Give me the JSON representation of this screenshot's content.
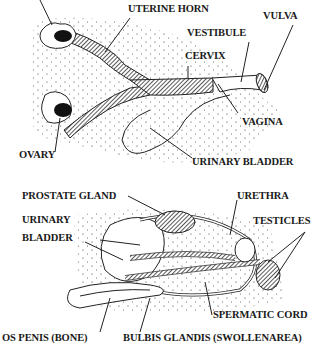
{
  "diagram": {
    "female": {
      "labels": {
        "uterine_horn": "UTERINE HORN",
        "vestibule": "VESTIBULE",
        "vulva": "VULVA",
        "cervix": "CERVIX",
        "vagina": "VAGINA",
        "ovary": "OVARY",
        "urinary_bladder": "URINARY BLADDER"
      }
    },
    "male": {
      "labels": {
        "prostate_gland": "PROSTATE GLAND",
        "urethra": "URETHRA",
        "urinary_bladder_1": "URINARY",
        "urinary_bladder_2": "BLADDER",
        "testicles": "TESTICLES",
        "spermatic_cord": "SPERMATIC CORD",
        "os_penis": "OS PENIS (BONE)",
        "bulbis_glandis": "BULBIS GLANDIS (SWOLLENAREA)"
      }
    },
    "colors": {
      "ink": "#1a1a1a",
      "background": "#ffffff"
    }
  }
}
